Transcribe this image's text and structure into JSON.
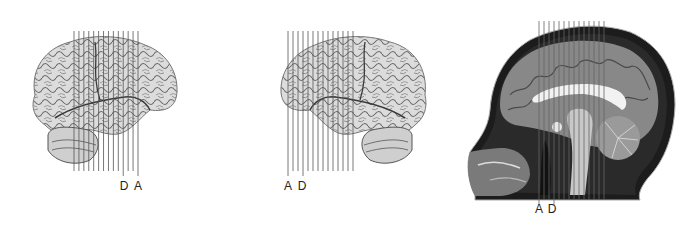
{
  "panels": [
    {
      "id": "left-hemisphere-lateral",
      "description": "lateral view of brain, facing right",
      "lines": {
        "count": 14,
        "x_start": 74,
        "x_end": 138,
        "y_top": 31,
        "y_bottom": 171
      },
      "labels": [
        {
          "text": "D",
          "x": 124,
          "y": 190
        },
        {
          "text": "A",
          "x": 138,
          "y": 190
        }
      ]
    },
    {
      "id": "right-hemisphere-lateral",
      "description": "lateral view of brain, facing left",
      "lines": {
        "count": 14,
        "x_start": 288,
        "x_end": 353,
        "y_top": 31,
        "y_bottom": 171
      },
      "labels": [
        {
          "text": "A",
          "x": 288,
          "y": 190
        },
        {
          "text": "D",
          "x": 302,
          "y": 190
        }
      ]
    },
    {
      "id": "sagittal-mri",
      "description": "midsagittal MRI of head, facing left",
      "lines": {
        "count": 14,
        "x_start": 539,
        "x_end": 604,
        "y_top": 21,
        "y_bottom": 200
      },
      "labels": [
        {
          "text": "A",
          "x": 539,
          "y": 213
        },
        {
          "text": "D",
          "x": 552,
          "y": 213
        }
      ]
    }
  ],
  "colors": {
    "line": "#555555",
    "brain_fill": "#d9d9d9",
    "brain_sulci": "#5a5a5a",
    "mri_bg": "#777777",
    "mri_dark": "#1a1a1a",
    "mri_light": "#f0f0f0"
  }
}
